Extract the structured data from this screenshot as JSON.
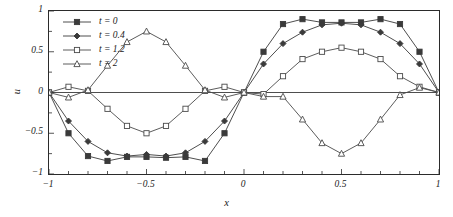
{
  "chart_data": {
    "type": "line",
    "title": "",
    "xlabel": "x",
    "ylabel": "u",
    "xlim": [
      -1,
      1
    ],
    "ylim": [
      -1,
      1
    ],
    "grid": false,
    "legend_position": "upper-left",
    "xticks": [
      "-1",
      "-0.5",
      "0",
      "0.5",
      "1"
    ],
    "xtick_values": [
      -1,
      -0.5,
      0,
      0.5,
      1
    ],
    "yticks": [
      "-1",
      "-0.5",
      "0",
      "0.5",
      "1"
    ],
    "ytick_values": [
      -1,
      -0.5,
      0,
      0.5,
      1
    ],
    "x": [
      -1,
      -0.9,
      -0.8,
      -0.7,
      -0.6,
      -0.5,
      -0.4,
      -0.3,
      -0.2,
      -0.1,
      0,
      0.1,
      0.2,
      0.3,
      0.4,
      0.5,
      0.6,
      0.7,
      0.8,
      0.9,
      1
    ],
    "series": [
      {
        "name": "t = 0",
        "marker": "filled-square",
        "color": "#3a3a3a",
        "values": [
          0,
          -0.5,
          -0.78,
          -0.84,
          -0.79,
          -0.79,
          -0.8,
          -0.79,
          -0.84,
          -0.5,
          0,
          0.5,
          0.84,
          0.9,
          0.86,
          0.86,
          0.86,
          0.9,
          0.84,
          0.5,
          0
        ]
      },
      {
        "name": "t = 0.4",
        "marker": "filled-diamond",
        "color": "#3a3a3a",
        "values": [
          0,
          -0.35,
          -0.6,
          -0.74,
          -0.78,
          -0.76,
          -0.78,
          -0.74,
          -0.6,
          -0.35,
          0,
          0.35,
          0.6,
          0.74,
          0.83,
          0.85,
          0.83,
          0.74,
          0.6,
          0.35,
          0
        ]
      },
      {
        "name": "t = 1.2",
        "marker": "open-square",
        "color": "#4a4a4a",
        "values": [
          0,
          0.07,
          0.02,
          -0.2,
          -0.41,
          -0.5,
          -0.41,
          -0.2,
          0.02,
          0.07,
          0,
          -0.02,
          0.2,
          0.41,
          0.5,
          0.55,
          0.5,
          0.41,
          0.2,
          0.07,
          0
        ]
      },
      {
        "name": "t = 2",
        "marker": "open-triangle",
        "color": "#4a4a4a",
        "values": [
          0,
          -0.06,
          0.03,
          0.33,
          0.62,
          0.75,
          0.62,
          0.33,
          0.03,
          -0.06,
          0,
          -0.05,
          -0.05,
          -0.33,
          -0.62,
          -0.75,
          -0.62,
          -0.33,
          -0.03,
          0.06,
          0
        ]
      }
    ]
  },
  "legend": {
    "items": [
      {
        "label": "t = 0",
        "marker": "filled-square"
      },
      {
        "label": "t = 0.4",
        "marker": "filled-diamond"
      },
      {
        "label": "t = 1.2",
        "marker": "open-square"
      },
      {
        "label": "t = 2",
        "marker": "open-triangle"
      }
    ]
  }
}
